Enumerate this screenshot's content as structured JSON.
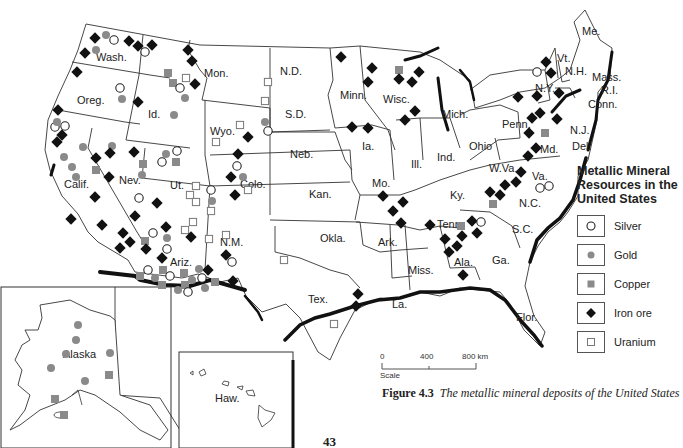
{
  "figure": {
    "number": "Figure 4.3",
    "caption": "The metallic mineral deposits of the United States",
    "page_number": "43"
  },
  "legend": {
    "title": "Metallic Mineral Resources in the United States",
    "items": [
      {
        "symbol": "open-circle",
        "label": "Silver"
      },
      {
        "symbol": "gray-dot",
        "label": "Gold"
      },
      {
        "symbol": "gray-square",
        "label": "Copper"
      },
      {
        "symbol": "black-diamond",
        "label": "Iron ore"
      },
      {
        "symbol": "open-square",
        "label": "Uranium"
      }
    ]
  },
  "scale": {
    "ticks": [
      "0",
      "400",
      "800 km"
    ],
    "label": "Scale"
  },
  "states": {
    "wash": "Wash.",
    "oreg": "Oreg.",
    "calif": "Calif.",
    "id": "Id.",
    "nev": "Nev.",
    "mon": "Mon.",
    "wyo": "Wyo.",
    "ut": "Ut.",
    "colo": "Colo.",
    "ariz": "Ariz.",
    "nm": "N.M.",
    "nd": "N.D.",
    "sd": "S.D.",
    "neb": "Neb.",
    "kan": "Kan.",
    "okla": "Okla.",
    "tex": "Tex.",
    "minn": "Minn.",
    "ia": "Ia.",
    "mo": "Mo.",
    "ark": "Ark.",
    "la": "La.",
    "wisc": "Wisc.",
    "ill": "Ill.",
    "mich": "Mich.",
    "ind": "Ind.",
    "ohio": "Ohio",
    "ky": "Ky.",
    "tenn": "Tenn.",
    "miss": "Miss.",
    "ala": "Ala.",
    "ga": "Ga.",
    "flor": "Flor.",
    "sc": "S.C.",
    "nc": "N.C.",
    "va": "Va.",
    "wva": "W.Va.",
    "penn": "Penn.",
    "ny": "N.Y.",
    "md": "Md.",
    "del": "Del.",
    "nj": "N.J.",
    "conn": "Conn.",
    "ri": "R.I.",
    "mass": "Mass.",
    "vt": "Vt.",
    "nh": "N.H.",
    "me": "Me.",
    "alaska": "Alaska",
    "haw": "Haw."
  },
  "colors": {
    "outline": "#333333",
    "coast": "#111111",
    "gold": "#8a8a8a",
    "copper": "#8a8a8a",
    "iron": "#111111"
  }
}
